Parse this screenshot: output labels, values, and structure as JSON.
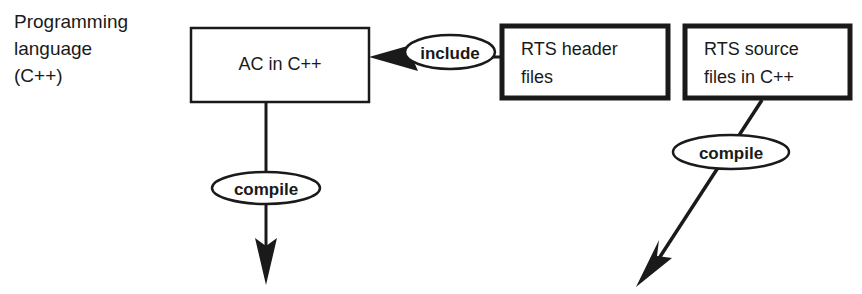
{
  "diagram": {
    "title_label": {
      "lines": [
        "Programming",
        "language",
        "(C++)"
      ]
    },
    "nodes": [
      {
        "id": "ac-in-cpp",
        "name": "ac-in-cpp-box",
        "lines": [
          "AC in C++"
        ],
        "border": "thin",
        "align": "center",
        "x": 191,
        "y": 28,
        "width": 178,
        "height": 74
      },
      {
        "id": "rts-header-files",
        "name": "rts-header-files-box",
        "lines": [
          "RTS header",
          "files"
        ],
        "border": "thick",
        "align": "left",
        "x": 500,
        "y": 24,
        "width": 170,
        "height": 76
      },
      {
        "id": "rts-source-files",
        "name": "rts-source-files-box",
        "lines": [
          "RTS source",
          "files in C++"
        ],
        "border": "thick",
        "align": "left",
        "x": 683,
        "y": 24,
        "width": 169,
        "height": 76
      }
    ],
    "edge_labels": [
      {
        "id": "include",
        "text": "include",
        "cx": 450,
        "cy": 52,
        "rx": 45,
        "ry": 17
      },
      {
        "id": "compile-left",
        "text": "compile",
        "cx": 266,
        "cy": 188,
        "rx": 54,
        "ry": 16
      },
      {
        "id": "compile-right",
        "text": "compile",
        "cx": 731,
        "cy": 152,
        "rx": 58,
        "ry": 17
      }
    ],
    "colors": {
      "stroke": "#1a1a1a",
      "background": "#ffffff",
      "text": "#1a1a1a"
    }
  }
}
